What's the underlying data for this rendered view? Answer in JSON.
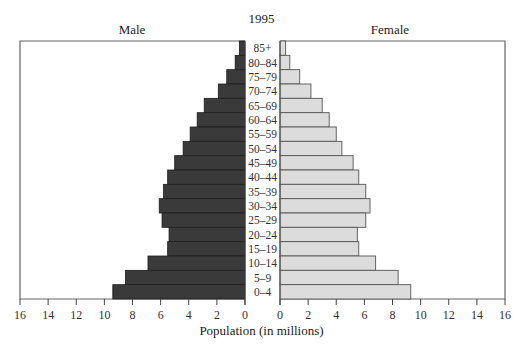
{
  "chart_data": {
    "type": "bar",
    "orientation": "horizontal",
    "subtype": "population-pyramid",
    "title": "1995",
    "left_panel_label": "Male",
    "right_panel_label": "Female",
    "xlabel": "Population (in millions)",
    "ylabel": "",
    "categories": [
      "85+",
      "80–84",
      "75–79",
      "70–74",
      "65–69",
      "60–64",
      "55–59",
      "50–54",
      "45–49",
      "40–44",
      "35–39",
      "30–34",
      "25–29",
      "20–24",
      "15–19",
      "10–14",
      "5–9",
      "0–4"
    ],
    "series": [
      {
        "name": "Male",
        "color": "#3a3a3a",
        "values": [
          0.4,
          0.7,
          1.3,
          1.9,
          2.9,
          3.4,
          3.9,
          4.4,
          5.0,
          5.5,
          5.8,
          6.1,
          5.9,
          5.4,
          5.5,
          6.9,
          8.5,
          9.4
        ]
      },
      {
        "name": "Female",
        "color": "#dcdcdc",
        "values": [
          0.4,
          0.7,
          1.4,
          2.2,
          3.0,
          3.5,
          4.0,
          4.4,
          5.2,
          5.6,
          6.1,
          6.4,
          6.1,
          5.5,
          5.6,
          6.8,
          8.4,
          9.3
        ]
      }
    ],
    "xlim": [
      0,
      16
    ],
    "left_ticks": [
      "16",
      "14",
      "12",
      "10",
      "8",
      "6",
      "4",
      "2",
      "0"
    ],
    "right_ticks": [
      "0",
      "2",
      "4",
      "6",
      "8",
      "10",
      "12",
      "14",
      "16"
    ],
    "grid": false,
    "legend": "none"
  }
}
